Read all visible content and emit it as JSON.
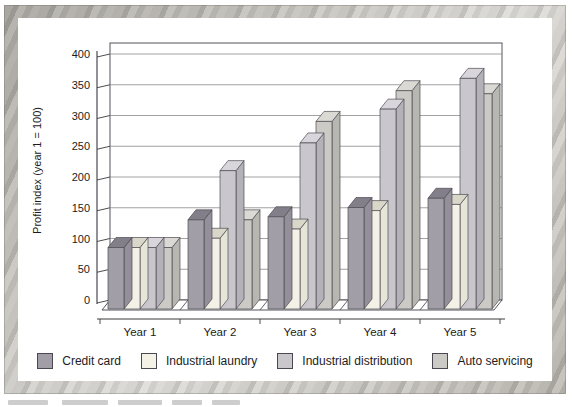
{
  "colors": {
    "panel_bg": "#ffffff",
    "wall_border": "#55525a",
    "gridline": "#8a8a8a",
    "axis": "#3a383e",
    "text": "#1c1c1c",
    "frame_marble": [
      "#c6c3bd",
      "#b0ada7",
      "#d6d3cd",
      "#bdbab4"
    ]
  },
  "chart_data": {
    "type": "bar",
    "projection": "3d-column",
    "title": "",
    "xlabel": "",
    "ylabel": "Profit index (year 1 = 100)",
    "ylim": [
      0,
      400
    ],
    "y_ticks": [
      0,
      50,
      100,
      150,
      200,
      250,
      300,
      350,
      400
    ],
    "grid": true,
    "legend_position": "bottom",
    "categories": [
      "Year 1",
      "Year 2",
      "Year 3",
      "Year 4",
      "Year 5"
    ],
    "series": [
      {
        "name": "Credit card",
        "color": "#a29ea7",
        "top_color": "#837f8a",
        "side_color": "#94909b",
        "values": [
          100,
          145,
          150,
          165,
          180
        ]
      },
      {
        "name": "Industrial laundry",
        "color": "#f4f2e6",
        "top_color": "#d9d7c9",
        "side_color": "#e7e5d8",
        "values": [
          100,
          115,
          130,
          160,
          170
        ]
      },
      {
        "name": "Industrial distribution",
        "color": "#c9c7cc",
        "top_color": "#d8d6db",
        "side_color": "#b4b2b8",
        "values": [
          100,
          225,
          270,
          325,
          375
        ]
      },
      {
        "name": "Auto servicing",
        "color": "#cccac5",
        "top_color": "#dbd9d4",
        "side_color": "#b8b6b1",
        "values": [
          100,
          145,
          305,
          355,
          350
        ]
      }
    ]
  }
}
